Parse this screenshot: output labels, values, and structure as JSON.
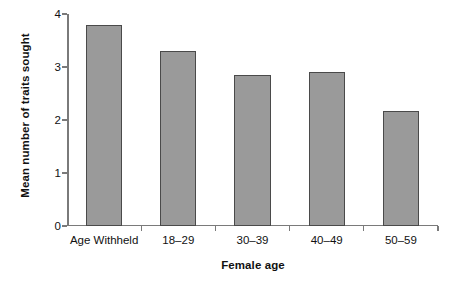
{
  "chart_data": {
    "type": "bar",
    "title": "",
    "xlabel": "Female age",
    "ylabel": "Mean number of traits sought",
    "categories": [
      "Age Withheld",
      "18–29",
      "30–39",
      "40–49",
      "50–59"
    ],
    "values": [
      3.8,
      3.3,
      2.85,
      2.9,
      2.17
    ],
    "ylim": [
      0,
      4
    ],
    "yticks": [
      0,
      1,
      2,
      3,
      4
    ],
    "ytick_labels": [
      "0",
      "1",
      "2",
      "3",
      "4"
    ],
    "grid": false,
    "legend": null,
    "bar_color": "#9a9a9a",
    "bar_edge_color": "#4a4a4a",
    "axis_color": "#7a7a7a",
    "background": "#ffffff"
  }
}
